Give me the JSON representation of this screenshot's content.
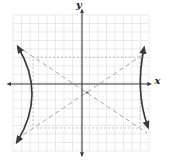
{
  "figure": {
    "canvas": {
      "width": 170,
      "height": 167,
      "background": "#ffffff"
    },
    "grid": {
      "x0": 13,
      "y0": 15,
      "x1": 149,
      "y1": 151,
      "spacing": 8.5,
      "color": "#dcdcdc"
    },
    "axes": {
      "color": "#3d3d3d",
      "x": {
        "label": "x",
        "y": 84,
        "x_start": 8,
        "x_end": 150.5
      },
      "y": {
        "label": "y",
        "x": 82,
        "y_start": 10,
        "y_end": 155.5
      }
    },
    "asymptotes": {
      "color": "#a8a8a8",
      "lines": [
        {
          "x1": 17,
          "y1": 46,
          "x2": 147,
          "y2": 133
        },
        {
          "x1": 17,
          "y1": 139,
          "x2": 147,
          "y2": 52
        }
      ]
    },
    "central_rect": {
      "x": 33,
      "y": 57,
      "width": 107,
      "height": 71,
      "color": "#b3b3b3"
    },
    "center_point": {
      "x": 87,
      "y": 92.5,
      "color": "#8f8f8f"
    },
    "hyperbola": {
      "color": "#3a3a3a",
      "branches": [
        {
          "name": "left-branch",
          "path": "M 18 47 Q 46.5 94.5 17 142"
        },
        {
          "name": "right-branch",
          "path": "M 144 48 Q 135 92 148 127"
        }
      ]
    }
  },
  "chart_data": {
    "type": "line",
    "title": "",
    "xlabel": "x",
    "ylabel": "y",
    "grid": true,
    "tick_labels_shown": false,
    "xlim_cells": [
      -8,
      8
    ],
    "ylim_cells": [
      -8.5,
      8
    ],
    "figure_kind": "hyperbola opening left-right with dashed asymptotes, dotted central rectangle and marked center",
    "hyperbola": {
      "orientation": "horizontal",
      "center_estimate_cells": [
        0.5,
        -1
      ],
      "a_estimate_cells": 6,
      "b_estimate_cells": 4,
      "vertices_estimate_cells": [
        [
          -6,
          -1
        ],
        [
          6.5,
          -1
        ]
      ],
      "asymptote_slopes_estimate": [
        0.66,
        -0.66
      ]
    },
    "series": [
      {
        "name": "left-branch",
        "points_px": [
          [
            18,
            47
          ],
          [
            32,
            93
          ],
          [
            17,
            142
          ]
        ]
      },
      {
        "name": "right-branch",
        "points_px": [
          [
            144,
            48
          ],
          [
            140.5,
            92
          ],
          [
            148,
            127
          ]
        ]
      },
      {
        "name": "asymptote-1",
        "points_px": [
          [
            17,
            46
          ],
          [
            147,
            133
          ]
        ]
      },
      {
        "name": "asymptote-2",
        "points_px": [
          [
            17,
            139
          ],
          [
            147,
            52
          ]
        ]
      },
      {
        "name": "central-rectangle-px",
        "points_px": [
          [
            33,
            57
          ],
          [
            140,
            57
          ],
          [
            140,
            128
          ],
          [
            33,
            128
          ]
        ]
      },
      {
        "name": "center-point-px",
        "points_px": [
          [
            87,
            92.5
          ]
        ]
      }
    ]
  }
}
